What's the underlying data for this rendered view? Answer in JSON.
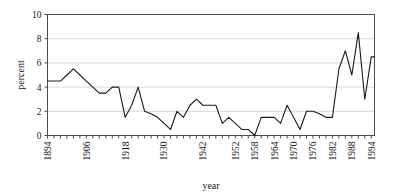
{
  "chart_data": {
    "type": "line",
    "title": "",
    "xlabel": "year",
    "ylabel": "percent",
    "xlim": [
      1894,
      1995
    ],
    "ylim": [
      0,
      10
    ],
    "ytick_values": [
      0,
      2,
      4,
      6,
      8,
      10
    ],
    "ytick_labels": [
      "0",
      "2",
      "4",
      "6",
      "8",
      "10"
    ],
    "xtick_labels": [
      "1894",
      "1906",
      "1918",
      "1930",
      "1942",
      "1952",
      "1958",
      "1964",
      "1970",
      "1976",
      "1982",
      "1988",
      "1994"
    ],
    "xtick_values": [
      1894,
      1906,
      1918,
      1930,
      1942,
      1952,
      1958,
      1964,
      1970,
      1976,
      1982,
      1988,
      1994
    ],
    "grid": "horizontal",
    "legend": "none",
    "line_color": "#1a1a1a",
    "grid_color": "#d9d9d9",
    "frame_color": "#4d4d4d",
    "background": "#ffffff",
    "x": [
      1894,
      1896,
      1898,
      1900,
      1902,
      1904,
      1906,
      1908,
      1910,
      1912,
      1914,
      1916,
      1918,
      1920,
      1922,
      1924,
      1926,
      1928,
      1930,
      1932,
      1934,
      1936,
      1938,
      1940,
      1942,
      1944,
      1946,
      1948,
      1950,
      1952,
      1954,
      1956,
      1958,
      1960,
      1962,
      1964,
      1966,
      1968,
      1970,
      1972,
      1974,
      1976,
      1978,
      1980,
      1982,
      1984,
      1986,
      1988,
      1990,
      1992,
      1994,
      1995
    ],
    "values": [
      4.5,
      4.5,
      4.5,
      5.0,
      5.5,
      5.0,
      4.5,
      4.0,
      3.5,
      3.5,
      4.0,
      4.0,
      1.5,
      2.5,
      4.0,
      2.0,
      1.8,
      1.5,
      1.0,
      0.5,
      2.0,
      1.5,
      2.5,
      3.0,
      2.5,
      2.5,
      2.5,
      1.0,
      1.5,
      1.0,
      0.5,
      0.5,
      0.0,
      1.5,
      1.5,
      1.5,
      1.0,
      2.5,
      1.5,
      0.5,
      2.0,
      2.0,
      1.8,
      1.5,
      1.5,
      5.5,
      7.0,
      5.0,
      8.5,
      3.0,
      6.5,
      6.5
    ],
    "series_name": "percent"
  }
}
